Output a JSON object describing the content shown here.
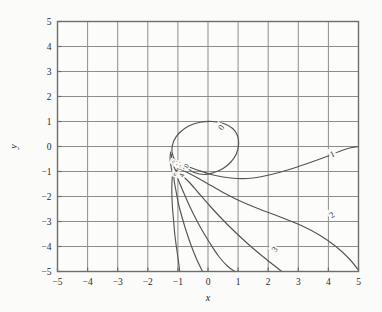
{
  "figure": {
    "background_color": "#fbfbfa",
    "frame_color": "#6e6e6e",
    "grid_color": "#8d8d8d",
    "curve_color": "#545454"
  },
  "chart_data": {
    "type": "line",
    "title": "",
    "subtitle": "",
    "xlabel": "x",
    "ylabel": "y",
    "xlim": [
      -5,
      5
    ],
    "ylim": [
      -5,
      5
    ],
    "grid": true,
    "legend": "none",
    "xticks": [
      "-5",
      "-4",
      "-3",
      "-2",
      "-1",
      "0",
      "1",
      "2",
      "3",
      "4",
      "5"
    ],
    "yticks": [
      "5",
      "4",
      "3",
      "2",
      "1",
      "0",
      "-1",
      "-2",
      "-3",
      "-4",
      "-5"
    ],
    "xtick_values": [
      -5,
      -4,
      -3,
      -2,
      -1,
      0,
      1,
      2,
      3,
      4,
      5
    ],
    "ytick_values": [
      5,
      4,
      3,
      2,
      1,
      0,
      -1,
      -2,
      -3,
      -4,
      -5
    ],
    "contour_levels": [
      0,
      1,
      2,
      3,
      4,
      5
    ],
    "annotations": [
      {
        "label": "0",
        "x": 0.42,
        "y": 0.78,
        "rotation": -55
      },
      {
        "label": "1",
        "x": 4.12,
        "y": -0.28,
        "rotation": -25
      },
      {
        "label": "2",
        "x": 4.1,
        "y": -2.72,
        "rotation": -35
      },
      {
        "label": "3",
        "x": 2.2,
        "y": -4.1,
        "rotation": -55
      },
      {
        "label": "3",
        "x": -1.12,
        "y": -0.62,
        "rotation": -70
      },
      {
        "label": "1",
        "x": -1.0,
        "y": -0.74,
        "rotation": -70
      },
      {
        "label": "2",
        "x": -0.88,
        "y": -0.8,
        "rotation": -70
      },
      {
        "label": "0",
        "x": -0.74,
        "y": -0.76,
        "rotation": -70
      },
      {
        "label": "5",
        "x": -1.08,
        "y": -1.12,
        "rotation": -70
      },
      {
        "label": "4",
        "x": -0.9,
        "y": -1.14,
        "rotation": -70
      }
    ],
    "series": [
      {
        "name": "level-0-loop",
        "level": 0,
        "points": [
          [
            -1.12,
            -0.52
          ],
          [
            -1.2,
            -0.18
          ],
          [
            -1.14,
            0.22
          ],
          [
            -0.94,
            0.56
          ],
          [
            -0.64,
            0.82
          ],
          [
            -0.26,
            0.97
          ],
          [
            0.14,
            1.0
          ],
          [
            0.52,
            0.92
          ],
          [
            0.82,
            0.72
          ],
          [
            0.98,
            0.44
          ],
          [
            1.02,
            0.1
          ],
          [
            0.94,
            -0.3
          ],
          [
            0.76,
            -0.62
          ],
          [
            0.5,
            -0.88
          ],
          [
            0.2,
            -1.04
          ],
          [
            -0.12,
            -1.12
          ],
          [
            -0.46,
            -1.04
          ],
          [
            -0.72,
            -0.84
          ],
          [
            -0.94,
            -0.66
          ],
          [
            -1.12,
            -0.52
          ]
        ]
      },
      {
        "name": "level-0-branch-right",
        "level": 0,
        "points": [
          [
            -0.7,
            -0.78
          ],
          [
            -0.3,
            -0.96
          ],
          [
            0.1,
            -1.12
          ],
          [
            0.5,
            -1.22
          ],
          [
            0.95,
            -1.28
          ],
          [
            1.5,
            -1.26
          ],
          [
            2.1,
            -1.12
          ],
          [
            2.7,
            -0.92
          ],
          [
            3.3,
            -0.68
          ],
          [
            3.9,
            -0.42
          ],
          [
            4.45,
            -0.16
          ],
          [
            4.78,
            -0.04
          ],
          [
            5.0,
            0.0
          ]
        ]
      },
      {
        "name": "level-1",
        "level": 1,
        "points": [
          [
            -1.02,
            -0.86
          ],
          [
            -0.72,
            -1.02
          ],
          [
            -0.34,
            -1.26
          ],
          [
            0.1,
            -1.56
          ],
          [
            0.6,
            -1.9
          ],
          [
            1.1,
            -2.2
          ],
          [
            1.7,
            -2.5
          ],
          [
            2.4,
            -2.82
          ],
          [
            3.1,
            -3.16
          ],
          [
            3.7,
            -3.54
          ],
          [
            4.25,
            -4.0
          ],
          [
            4.7,
            -4.5
          ],
          [
            5.0,
            -4.95
          ]
        ]
      },
      {
        "name": "level-2",
        "level": 2,
        "points": [
          [
            -1.06,
            -0.94
          ],
          [
            -0.86,
            -1.16
          ],
          [
            -0.6,
            -1.46
          ],
          [
            -0.3,
            -1.88
          ],
          [
            0.05,
            -2.36
          ],
          [
            0.45,
            -2.88
          ],
          [
            0.9,
            -3.42
          ],
          [
            1.35,
            -3.92
          ],
          [
            1.8,
            -4.38
          ],
          [
            2.2,
            -4.76
          ],
          [
            2.45,
            -5.0
          ]
        ]
      },
      {
        "name": "level-3",
        "level": 3,
        "points": [
          [
            -1.1,
            -1.0
          ],
          [
            -1.0,
            -1.3
          ],
          [
            -0.86,
            -1.7
          ],
          [
            -0.68,
            -2.2
          ],
          [
            -0.46,
            -2.76
          ],
          [
            -0.22,
            -3.3
          ],
          [
            0.06,
            -3.86
          ],
          [
            0.36,
            -4.4
          ],
          [
            0.66,
            -4.8
          ],
          [
            0.9,
            -5.0
          ]
        ]
      },
      {
        "name": "level-4",
        "level": 4,
        "points": [
          [
            -1.14,
            -1.06
          ],
          [
            -1.12,
            -1.4
          ],
          [
            -1.06,
            -1.8
          ],
          [
            -0.98,
            -2.3
          ],
          [
            -0.86,
            -2.84
          ],
          [
            -0.72,
            -3.4
          ],
          [
            -0.56,
            -3.96
          ],
          [
            -0.38,
            -4.5
          ],
          [
            -0.24,
            -4.86
          ],
          [
            -0.18,
            -5.0
          ]
        ]
      },
      {
        "name": "level-5",
        "level": 5,
        "points": [
          [
            -1.18,
            -1.12
          ],
          [
            -1.2,
            -1.5
          ],
          [
            -1.2,
            -1.95
          ],
          [
            -1.18,
            -2.45
          ],
          [
            -1.14,
            -3.0
          ],
          [
            -1.1,
            -3.55
          ],
          [
            -1.04,
            -4.1
          ],
          [
            -0.98,
            -4.6
          ],
          [
            -0.94,
            -5.0
          ]
        ]
      },
      {
        "name": "inner-fan-a",
        "level": 0,
        "points": [
          [
            -1.22,
            -0.3
          ],
          [
            -1.2,
            -0.5
          ],
          [
            -1.16,
            -0.7
          ],
          [
            -1.1,
            -0.9
          ],
          [
            -1.02,
            -1.06
          ]
        ]
      },
      {
        "name": "inner-fan-b",
        "level": 0,
        "points": [
          [
            -1.24,
            -0.22
          ],
          [
            -1.26,
            -0.46
          ],
          [
            -1.24,
            -0.72
          ],
          [
            -1.2,
            -0.96
          ],
          [
            -1.16,
            -1.12
          ]
        ]
      }
    ]
  }
}
